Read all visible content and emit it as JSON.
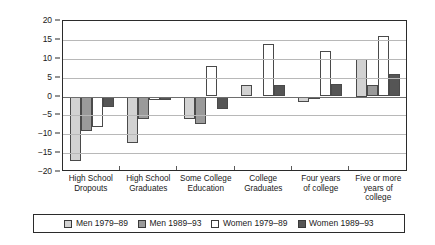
{
  "chart_data": {
    "type": "bar",
    "title": "",
    "subtitle": "",
    "xlabel": "",
    "ylabel": "",
    "ylim": [
      -20,
      20
    ],
    "ytick_labels": [
      "20",
      "15",
      "10",
      "5",
      "0",
      "-5",
      "-10",
      "-15",
      "-20"
    ],
    "ytick_values": [
      20,
      15,
      10,
      5,
      0,
      -5,
      -10,
      -15,
      -20
    ],
    "grid": true,
    "legend_position": "bottom",
    "categories": [
      "High School\nDropouts",
      "High School\nGraduates",
      "Some College\nEducation",
      "College\nGraduates",
      "Four years\nof college",
      "Five or more\nyears of\ncollege"
    ],
    "series": [
      {
        "name": "Men 1979–89",
        "color": "#d2d2d2",
        "values": [
          -17.2,
          -12.2,
          -6.0,
          3.0,
          -1.5,
          10.0
        ]
      },
      {
        "name": "Men 1989–93",
        "color": "#9a9a9a",
        "values": [
          -9.2,
          -6.0,
          -7.4,
          0.0,
          -0.7,
          3.0
        ]
      },
      {
        "name": "Women 1979–89",
        "color": "#ffffff",
        "values": [
          -8.2,
          -1.0,
          8.0,
          14.0,
          12.0,
          16.0
        ]
      },
      {
        "name": "Women 1989–93",
        "color": "#555555",
        "values": [
          -2.8,
          -1.0,
          -3.2,
          3.0,
          3.2,
          6.0
        ]
      }
    ]
  },
  "legend": {
    "items": [
      {
        "label": "Men 1979–89",
        "swatch": "men-1979-89-swatch"
      },
      {
        "label": "Men 1989–93",
        "swatch": "men-1989-93-swatch"
      },
      {
        "label": "Women 1979–89",
        "swatch": "women-1979-89-swatch"
      },
      {
        "label": "Women 1989–93",
        "swatch": "women-1989-93-swatch"
      }
    ]
  }
}
